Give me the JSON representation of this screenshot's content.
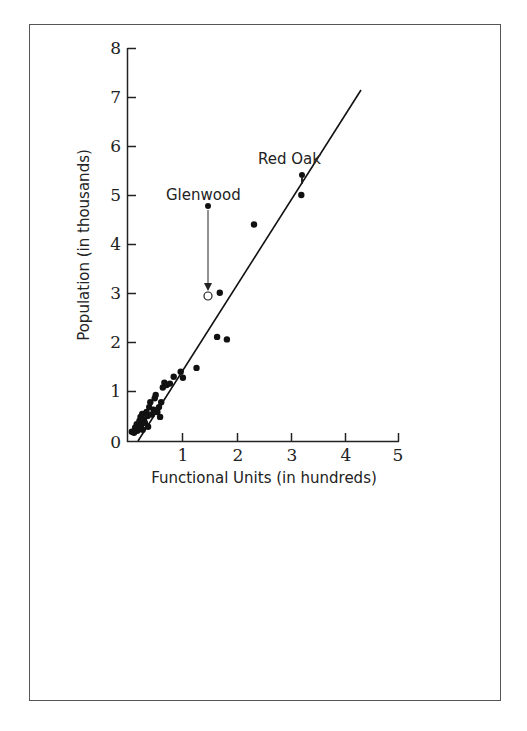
{
  "chart_data": {
    "type": "scatter",
    "title": "",
    "xlabel": "Functional Units (in hundreds)",
    "ylabel": "Population (in thousands)",
    "xlim": [
      0,
      5
    ],
    "ylim": [
      0,
      8
    ],
    "x_ticks": [
      "1",
      "2",
      "3",
      "4",
      "5"
    ],
    "y_ticks": [
      "0",
      "1",
      "2",
      "3",
      "4",
      "5",
      "6",
      "7",
      "8"
    ],
    "grid": false,
    "legend": null,
    "series": [
      {
        "name": "Towns",
        "marker": "filled-circle",
        "points": [
          [
            0.08,
            0.2
          ],
          [
            0.12,
            0.18
          ],
          [
            0.14,
            0.28
          ],
          [
            0.17,
            0.35
          ],
          [
            0.18,
            0.22
          ],
          [
            0.2,
            0.3
          ],
          [
            0.22,
            0.42
          ],
          [
            0.24,
            0.5
          ],
          [
            0.25,
            0.32
          ],
          [
            0.27,
            0.56
          ],
          [
            0.28,
            0.24
          ],
          [
            0.3,
            0.45
          ],
          [
            0.32,
            0.38
          ],
          [
            0.35,
            0.6
          ],
          [
            0.37,
            0.52
          ],
          [
            0.38,
            0.3
          ],
          [
            0.4,
            0.7
          ],
          [
            0.42,
            0.8
          ],
          [
            0.45,
            0.55
          ],
          [
            0.48,
            0.65
          ],
          [
            0.5,
            0.88
          ],
          [
            0.52,
            0.95
          ],
          [
            0.55,
            0.6
          ],
          [
            0.58,
            0.7
          ],
          [
            0.6,
            0.5
          ],
          [
            0.62,
            0.8
          ],
          [
            0.65,
            1.1
          ],
          [
            0.68,
            1.2
          ],
          [
            0.72,
            1.15
          ],
          [
            0.78,
            1.18
          ],
          [
            0.85,
            1.32
          ],
          [
            0.98,
            1.42
          ],
          [
            1.02,
            1.3
          ],
          [
            1.27,
            1.5
          ],
          [
            1.65,
            2.13
          ],
          [
            1.83,
            2.08
          ],
          [
            1.7,
            3.03
          ],
          [
            2.33,
            4.42
          ],
          [
            3.2,
            5.02
          ]
        ]
      }
    ],
    "annotations": [
      {
        "label": "Glenwood",
        "from": [
          1.45,
          4.8
        ],
        "to": [
          1.45,
          2.95
        ],
        "note": "filled point with arrow down to open circle"
      },
      {
        "label": "Red Oak",
        "from": [
          3.2,
          6.45
        ],
        "to": [
          3.2,
          5.15
        ],
        "note": "filled point with arrow down to open circle"
      }
    ],
    "trend_line": {
      "x": [
        0.2,
        4.27
      ],
      "y": [
        0.0,
        7.15
      ]
    }
  },
  "labels": {
    "xlabel": "Functional Units (in hundreds)",
    "ylabel": "Population (in thousands)",
    "glenwood": "Glenwood",
    "red_oak": "Red Oak",
    "y0": "0",
    "y1": "1",
    "y2": "2",
    "y3": "3",
    "y4": "4",
    "y5": "5",
    "y6": "6",
    "y7": "7",
    "y8": "8",
    "x1": "1",
    "x2": "2",
    "x3": "3",
    "x4": "4",
    "x5": "5"
  },
  "colors": {
    "ink": "#1a1a1a",
    "frame": "#555555",
    "background": "#ffffff"
  }
}
